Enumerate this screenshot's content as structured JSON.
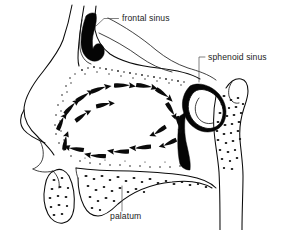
{
  "figure": {
    "background_color": "#ffffff",
    "ink_color": "#0a0a0a",
    "leader_color": "#4a4a4a",
    "style": "black-and-white anatomical line drawing with stippled bone texture"
  },
  "labels": [
    {
      "id": "frontal-sinus",
      "text": "frontal sinus",
      "x": 122,
      "y": 21,
      "leader": "M118.5,18.5 L104,18.5 L96,26"
    },
    {
      "id": "sphenoid-sinus",
      "text": "sphenoid sinus",
      "x": 208,
      "y": 60,
      "leader": "M205,57 L199,57 L199,82"
    },
    {
      "id": "palatum",
      "text": "palatum",
      "x": 110,
      "y": 216,
      "leader": "M122,211 L122,186"
    }
  ],
  "structures": [
    {
      "id": "frontal-sinus-cavity",
      "name": "frontal sinus",
      "description": "dark hook-shaped air cavity at superior-anterior skull"
    },
    {
      "id": "sphenoid-sinus-cavity",
      "name": "sphenoid sinus",
      "description": "oval air cavity posterior-superior to nasal cavity"
    },
    {
      "id": "nasal-cavity",
      "name": "nasal cavity",
      "description": "large central air space with circulating airflow"
    },
    {
      "id": "hard-palate",
      "name": "palatum",
      "description": "horizontal cancellous bone plate forming the nasal floor"
    },
    {
      "id": "nose-profile",
      "name": "external nose",
      "description": "anterior facial profile with nasal tip and nostril"
    },
    {
      "id": "clivus-column",
      "name": "posterior bone column",
      "description": "vertical stippled bone at posterior skull base"
    },
    {
      "id": "turbinate-roof",
      "name": "nasal roof",
      "description": "stippled cribriform roof of nasal cavity"
    },
    {
      "id": "upper-lip-bone",
      "name": "anterior alveolar bone",
      "description": "rounded speckled bone below nasal floor"
    }
  ],
  "airflow": {
    "description": "clockwise circulation of inspired air within the nasal cavity",
    "arrow_count": 18,
    "arrows": [
      {
        "x": 66,
        "y": 140,
        "angle": -78
      },
      {
        "x": 62,
        "y": 122,
        "angle": -62
      },
      {
        "x": 71,
        "y": 106,
        "angle": -44
      },
      {
        "x": 84,
        "y": 95,
        "angle": -30
      },
      {
        "x": 82,
        "y": 115,
        "angle": -34
      },
      {
        "x": 100,
        "y": 88,
        "angle": -16
      },
      {
        "x": 104,
        "y": 104,
        "angle": -10
      },
      {
        "x": 124,
        "y": 85,
        "angle": 2
      },
      {
        "x": 146,
        "y": 86,
        "angle": 10
      },
      {
        "x": 163,
        "y": 94,
        "angle": 38
      },
      {
        "x": 170,
        "y": 110,
        "angle": 62
      },
      {
        "x": 178,
        "y": 124,
        "angle": 80
      },
      {
        "x": 158,
        "y": 130,
        "angle": 150
      },
      {
        "x": 168,
        "y": 142,
        "angle": 158
      },
      {
        "x": 140,
        "y": 146,
        "angle": 178
      },
      {
        "x": 118,
        "y": 150,
        "angle": 182
      },
      {
        "x": 95,
        "y": 154,
        "angle": 186
      },
      {
        "x": 74,
        "y": 147,
        "angle": 192
      }
    ]
  }
}
